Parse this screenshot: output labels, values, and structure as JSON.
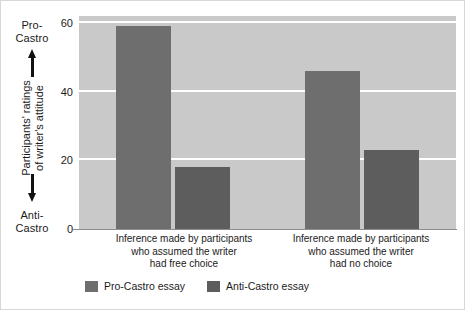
{
  "chart_data": {
    "type": "bar",
    "title": "",
    "subtitle": "",
    "xlabel": "",
    "ylabel": "Participants' ratings of writer's attitude",
    "ylim": [
      0,
      62
    ],
    "yticks": [
      0,
      20,
      40,
      60
    ],
    "ytick_labels": [
      "0",
      "20",
      "40",
      "60"
    ],
    "grid": "horizontal-white",
    "legend_position": "bottom-left",
    "categories": [
      "Inference made by participants who assumed the writer had free choice",
      "Inference made by participants who assumed the writer had no choice"
    ],
    "series": [
      {
        "name": "Pro-Castro essay",
        "values": [
          59,
          46
        ],
        "color": "#6e6e6e"
      },
      {
        "name": "Anti-Castro essay",
        "values": [
          18,
          23
        ],
        "color": "#5d5d5d"
      }
    ]
  },
  "axis": {
    "y_top_label": "Pro-\nCastro",
    "y_top_line1": "Pro-",
    "y_top_line2": "Castro",
    "y_bottom_line1": "Anti-",
    "y_bottom_line2": "Castro",
    "y_rotated_line1": "Participants' ratings",
    "y_rotated_line2": "of writer's attitude",
    "up_arrow_name": "up-arrow-icon",
    "down_arrow_name": "down-arrow-icon"
  },
  "x_groups": [
    {
      "line1": "Inference made by participants",
      "line2": "who assumed the writer",
      "line3": "had free choice"
    },
    {
      "line1": "Inference made by participants",
      "line2": "who assumed the writer",
      "line3": "had no choice"
    }
  ],
  "legend": [
    {
      "label": "Pro-Castro essay",
      "color": "#6e6e6e"
    },
    {
      "label": "Anti-Castro essay",
      "color": "#5d5d5d"
    }
  ],
  "colors": {
    "plot_background": "#c9c9c9",
    "gridline": "#ffffff",
    "canvas": "#ffffff",
    "text": "#1b1b1b",
    "border": "#d7d7d7"
  }
}
